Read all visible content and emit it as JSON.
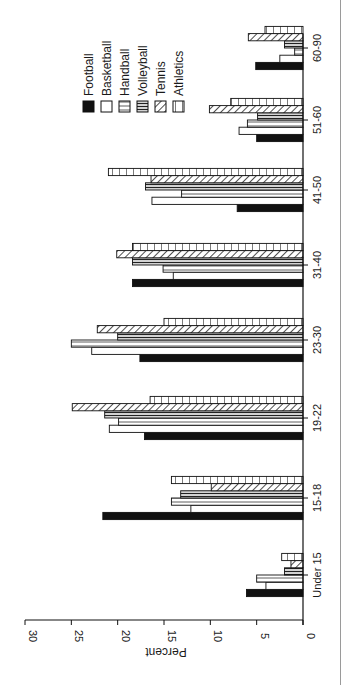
{
  "chart_data": {
    "type": "bar",
    "orientation": "rotated 90 degrees clockwise (vertical bar chart printed sideways)",
    "title": "",
    "xlabel": "",
    "ylabel": "Percent",
    "ylim": [
      0,
      30
    ],
    "yticks": [
      0,
      5,
      10,
      15,
      20,
      25,
      30
    ],
    "grid": false,
    "legend_position": "upper right (top of rotated page)",
    "categories": [
      "Under 15",
      "15-18",
      "19-22",
      "23-30",
      "31-40",
      "41-50",
      "51-60",
      "60-90"
    ],
    "series": [
      {
        "name": "Football",
        "pattern": "solid-black",
        "values": [
          6.1,
          21.6,
          17.1,
          17.6,
          18.4,
          7.1,
          5.0,
          5.1
        ]
      },
      {
        "name": "Basketball",
        "pattern": "white",
        "values": [
          4.0,
          12.1,
          20.9,
          22.8,
          14.0,
          16.3,
          6.9,
          2.5
        ]
      },
      {
        "name": "Handball",
        "pattern": "thin-lines",
        "values": [
          5.0,
          14.2,
          19.9,
          25.0,
          15.1,
          13.1,
          6.0,
          0.9
        ]
      },
      {
        "name": "Volleyball",
        "pattern": "thick-lines",
        "values": [
          2.0,
          13.2,
          21.4,
          20.0,
          18.4,
          17.0,
          4.9,
          2.0
        ]
      },
      {
        "name": "Tennis",
        "pattern": "diagonal-hatch",
        "values": [
          1.3,
          9.9,
          24.9,
          22.2,
          20.1,
          16.4,
          10.1,
          5.9
        ]
      },
      {
        "name": "Athletics",
        "pattern": "cross-bars",
        "values": [
          2.3,
          14.2,
          16.5,
          15.0,
          18.4,
          21.0,
          7.8,
          4.1
        ]
      }
    ]
  },
  "axis": {
    "ylabel": "Percent",
    "ticks": [
      "0",
      "5",
      "10",
      "15",
      "20",
      "25",
      "30"
    ]
  },
  "legend": {
    "items": [
      "Football",
      "Basketball",
      "Handball",
      "Volleyball",
      "Tennis",
      "Athletics"
    ]
  },
  "colors": {
    "ink": "#111111",
    "paper": "#ffffff"
  }
}
